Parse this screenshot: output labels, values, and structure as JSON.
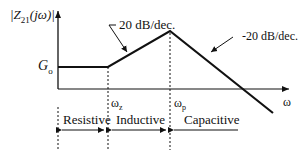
{
  "axes": {
    "y_label": "|Z",
    "y_label_sub": "21",
    "y_label_rest": "(jω)|",
    "x_label": "ω",
    "g0_base": "G",
    "g0_sub": "o"
  },
  "slopes": {
    "rising": "20 dB/dec.",
    "falling": "-20 dB/dec."
  },
  "frequencies": {
    "zero_base": "ω",
    "zero_sub": "z",
    "pole_base": "ω",
    "pole_sub": "p"
  },
  "regions": [
    {
      "label": "Resistive"
    },
    {
      "label": "Inductive"
    },
    {
      "label": "Capacitive"
    }
  ],
  "colors": {
    "line": "#111111",
    "background": "#ffffff"
  }
}
